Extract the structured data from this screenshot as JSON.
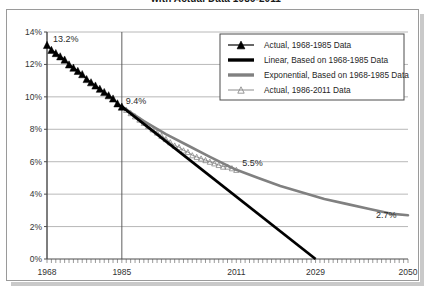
{
  "title": {
    "text": "with Actual Data 1986-2011",
    "note": "top line of title is clipped off the top edge of the screenshot"
  },
  "chart_data": {
    "type": "line",
    "title": "with Actual Data 1986-2011",
    "xlabel": "",
    "ylabel": "",
    "xlim": [
      1968,
      2050
    ],
    "ylim": [
      0,
      14
    ],
    "y_tick_labels": [
      "0%",
      "2%",
      "4%",
      "6%",
      "8%",
      "10%",
      "12%",
      "14%"
    ],
    "y_tick_values": [
      0,
      2,
      4,
      6,
      8,
      10,
      12,
      14
    ],
    "x_tick_labels": [
      "1968",
      "1985",
      "2011",
      "2029",
      "2050"
    ],
    "x_tick_values": [
      1968,
      1985,
      2011,
      2029,
      2050
    ],
    "minor_x_ticks": "annual",
    "grid": "horizontal",
    "legend_position": "top-right",
    "annotations": [
      {
        "label": "13.2%",
        "x": 1968,
        "y": 13.2
      },
      {
        "label": "9.4%",
        "x": 1985,
        "y": 9.4
      },
      {
        "label": "5.5%",
        "x": 2011,
        "y": 5.5
      },
      {
        "label": "2.7%",
        "x": 2050,
        "y": 2.7
      }
    ],
    "series": [
      {
        "name": "Actual, 1968-1985 Data",
        "marker": "filled-triangle",
        "color": "#000000",
        "x": [
          1968,
          1969,
          1970,
          1971,
          1972,
          1973,
          1974,
          1975,
          1976,
          1977,
          1978,
          1979,
          1980,
          1981,
          1982,
          1983,
          1984,
          1985
        ],
        "values": [
          13.2,
          12.9,
          12.7,
          12.5,
          12.3,
          12.0,
          11.8,
          11.6,
          11.4,
          11.1,
          10.9,
          10.7,
          10.5,
          10.3,
          10.1,
          9.9,
          9.6,
          9.4
        ]
      },
      {
        "name": "Linear, Based on 1968-1985 Data",
        "marker": "thick-line",
        "color": "#000000",
        "x": [
          1985,
          2029
        ],
        "values": [
          9.4,
          0.0
        ]
      },
      {
        "name": "Exponential, Based on 1968-1985 Data",
        "marker": "thick-line",
        "color": "#808080",
        "x": [
          1985,
          1990,
          1995,
          2000,
          2005,
          2011,
          2016,
          2021,
          2026,
          2031,
          2036,
          2041,
          2046,
          2050
        ],
        "values": [
          9.4,
          8.5,
          7.7,
          7.0,
          6.3,
          5.5,
          5.0,
          4.5,
          4.1,
          3.7,
          3.4,
          3.1,
          2.8,
          2.7
        ]
      },
      {
        "name": "Actual, 1986-2011 Data",
        "marker": "open-triangle",
        "color": "#808080",
        "x": [
          1986,
          1987,
          1988,
          1989,
          1990,
          1991,
          1992,
          1993,
          1994,
          1995,
          1996,
          1997,
          1998,
          1999,
          2000,
          2001,
          2002,
          2003,
          2004,
          2005,
          2006,
          2007,
          2008,
          2009,
          2010,
          2011
        ],
        "values": [
          9.2,
          9.0,
          8.8,
          8.6,
          8.4,
          8.2,
          8.0,
          7.8,
          7.6,
          7.4,
          7.2,
          7.0,
          6.9,
          6.7,
          6.6,
          6.4,
          6.3,
          6.2,
          6.1,
          6.0,
          5.9,
          5.8,
          5.7,
          5.7,
          5.6,
          5.5
        ]
      }
    ]
  },
  "legend": {
    "items": [
      {
        "label": "Actual, 1968-1985 Data",
        "symbol": "filled-triangle-marker"
      },
      {
        "label": "Linear, Based on 1968-1985 Data",
        "symbol": "black-thick-line"
      },
      {
        "label": "Exponential, Based on 1968-1985 Data",
        "symbol": "gray-thick-line"
      },
      {
        "label": "Actual, 1986-2011 Data",
        "symbol": "open-triangle-marker"
      }
    ]
  },
  "colors": {
    "black_series": "#000000",
    "gray_series": "#808080",
    "grid": "#a6a6a6",
    "axis": "#4d4d4d",
    "frame": "#9a9a9a",
    "shadow": "#c9c9c9"
  }
}
